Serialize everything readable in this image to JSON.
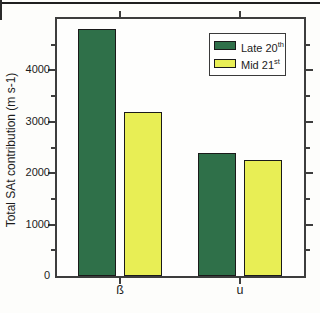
{
  "chart_data": {
    "type": "bar",
    "title": "",
    "categories": [
      "ß",
      "u"
    ],
    "series": [
      {
        "name": "Late 20th",
        "name_base": "Late 20",
        "name_sup": "th",
        "color": "#2f7049",
        "values": [
          4800,
          2400
        ]
      },
      {
        "name": "Mid 21st",
        "name_base": "Mid 21",
        "name_sup": "st",
        "color": "#e8ee55",
        "values": [
          3200,
          2250
        ]
      }
    ],
    "xlabel": "",
    "ylabel": "Total SAt contribution (m s-1)",
    "ylim": [
      0,
      5000
    ],
    "yticks": [
      0,
      1000,
      2000,
      3000,
      4000
    ],
    "minor_tick_step": 500,
    "grid": false,
    "legend_position": "top-right-inside",
    "bar_edge_color": "#1a1a1a"
  },
  "colors": {
    "frame": "#3d3d3d",
    "top_rule": "#1f1f1f",
    "background": "#fdfdfb",
    "text": "#1c1c1c"
  }
}
